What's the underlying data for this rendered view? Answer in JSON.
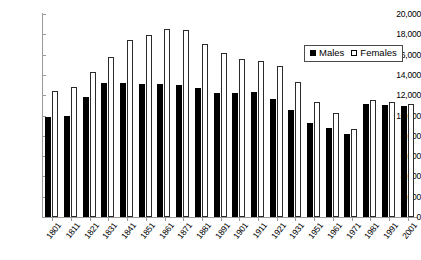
{
  "chart_data": {
    "type": "bar",
    "title": "",
    "xlabel": "",
    "ylabel": "",
    "ylim": [
      0,
      20000
    ],
    "ytick_step": 2000,
    "grid": false,
    "legend_position": "top-right",
    "categories": [
      "1801",
      "1811",
      "1821",
      "1831",
      "1841",
      "1851",
      "1861",
      "1871",
      "1881",
      "1891",
      "1901",
      "1911",
      "1921",
      "1931",
      "1951",
      "1961",
      "1971",
      "1981",
      "1991",
      "2001"
    ],
    "series": [
      {
        "name": "Males",
        "color": "#000000",
        "values": [
          9900,
          10000,
          11800,
          13200,
          13200,
          13100,
          13100,
          13000,
          12700,
          12200,
          12200,
          12300,
          11600,
          10500,
          9300,
          8800,
          8200,
          11100,
          11000,
          10900
        ]
      },
      {
        "name": "Females",
        "color": "#ffffff",
        "values": [
          12400,
          12800,
          14300,
          15800,
          17400,
          17900,
          18500,
          18400,
          17000,
          16200,
          15600,
          15400,
          14900,
          13300,
          11300,
          10200,
          8700,
          11500,
          11300,
          11100
        ]
      }
    ],
    "ytick_labels": [
      "0",
      "2,000",
      "4,000",
      "6,000",
      "8,000",
      "10,000",
      "12,000",
      "14,000",
      "16,000",
      "18,000",
      "20,000"
    ]
  },
  "legend": {
    "males_label": "Males",
    "females_label": "Females"
  }
}
